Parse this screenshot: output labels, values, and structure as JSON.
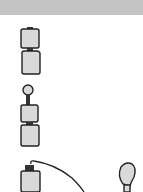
{
  "header": {
    "color": "#c4c4c4"
  },
  "colors": {
    "stroke": "#222222",
    "fill": "#d9d9d9",
    "cap": "#333333"
  },
  "diagram": {
    "items": [
      {
        "id": "two-batteries-stacked",
        "description": "two batteries stacked"
      },
      {
        "id": "bulb-on-two-batteries",
        "description": "bulb on top of two stacked batteries"
      },
      {
        "id": "battery-wired-to-bulb",
        "description": "battery connected by wire to bulb"
      }
    ]
  }
}
